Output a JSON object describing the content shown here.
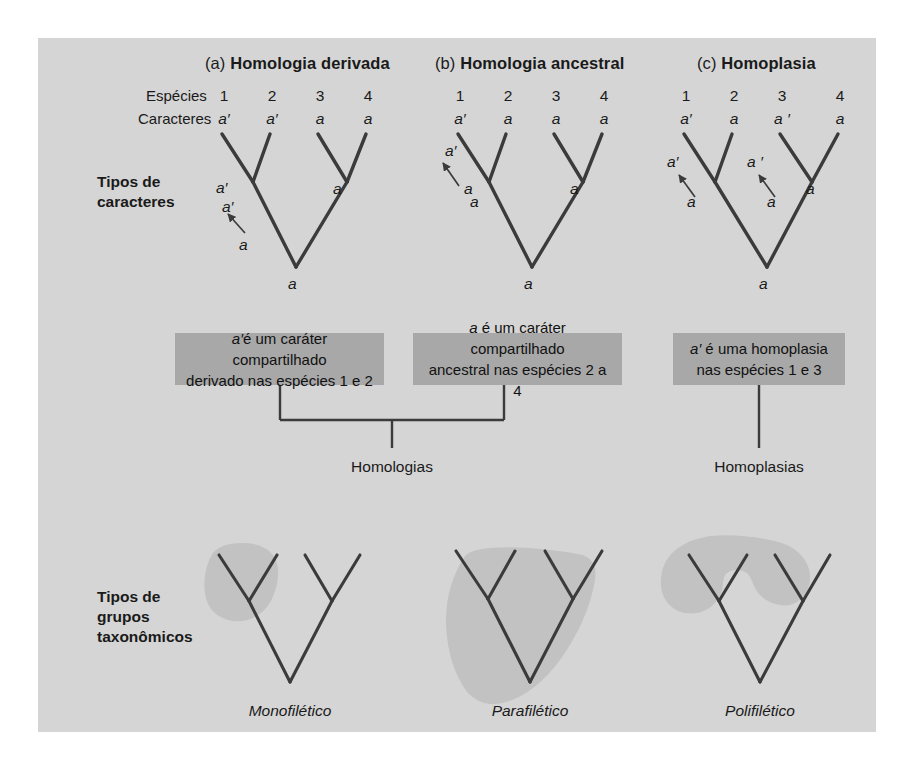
{
  "figure": {
    "background_color": "#d5d5d5",
    "page_color": "#ffffff",
    "line_color": "#3b3b3b",
    "callout_color": "#a8a8a8"
  },
  "panels": [
    {
      "tag": "(a)",
      "title": "Homologia derivada"
    },
    {
      "tag": "(b)",
      "title": "Homologia ancestral"
    },
    {
      "tag": "(c)",
      "title": "Homoplasia"
    }
  ],
  "row_labels": {
    "species": "Espécies",
    "characters": "Caracteres"
  },
  "species_numbers": [
    "1",
    "2",
    "3",
    "4"
  ],
  "characters": {
    "a": [
      "a′",
      "a′",
      "a",
      "a"
    ],
    "b": [
      "a′",
      "a",
      "a",
      "a"
    ],
    "c": [
      "a′",
      "a",
      "a ′",
      "a"
    ]
  },
  "side_labels": {
    "characters": [
      "Tipos de",
      "caracteres"
    ],
    "groups": [
      "Tipos de",
      "grupos",
      "taxonômicos"
    ]
  },
  "tree_node_labels": {
    "a": [
      {
        "text": "a′",
        "x": 216,
        "y": 189
      },
      {
        "text": "a′",
        "x": 222,
        "y": 208
      },
      {
        "text": "a",
        "x": 239,
        "y": 246
      },
      {
        "text": "a",
        "x": 333,
        "y": 190
      },
      {
        "text": "a",
        "x": 286,
        "y": 285
      }
    ],
    "b": [
      {
        "text": "a′",
        "x": 448,
        "y": 152
      },
      {
        "text": "a",
        "x": 465,
        "y": 190
      },
      {
        "text": "a",
        "x": 470,
        "y": 202
      },
      {
        "text": "a",
        "x": 570,
        "y": 190
      },
      {
        "text": "a",
        "x": 522,
        "y": 285
      }
    ],
    "c": [
      {
        "text": "a′",
        "x": 670,
        "y": 163
      },
      {
        "text": "a",
        "x": 690,
        "y": 203
      },
      {
        "text": "a ′",
        "x": 750,
        "y": 163
      },
      {
        "text": "a",
        "x": 770,
        "y": 203
      },
      {
        "text": "a",
        "x": 806,
        "y": 190
      },
      {
        "text": "a",
        "x": 757,
        "y": 285
      }
    ]
  },
  "callouts": [
    {
      "id": "derived",
      "line1_pre": "a′",
      "line1_rest": "é um caráter compartilhado",
      "line2": "derivado nas espécies 1 e 2"
    },
    {
      "id": "ancestral",
      "line1_pre": "a",
      "line1_rest": " é um caráter compartilhado",
      "line2": "ancestral nas espécies 2 a 4"
    },
    {
      "id": "homoplasy",
      "line1_pre": "a′",
      "line1_rest": " é uma homoplasia",
      "line2": "nas espécies 1 e 3"
    }
  ],
  "category_labels": {
    "homologies": "Homologias",
    "homoplasies": "Homoplasias"
  },
  "group_types": [
    {
      "name": "Monofilético"
    },
    {
      "name": "Parafilético"
    },
    {
      "name": "Polifilético"
    }
  ]
}
